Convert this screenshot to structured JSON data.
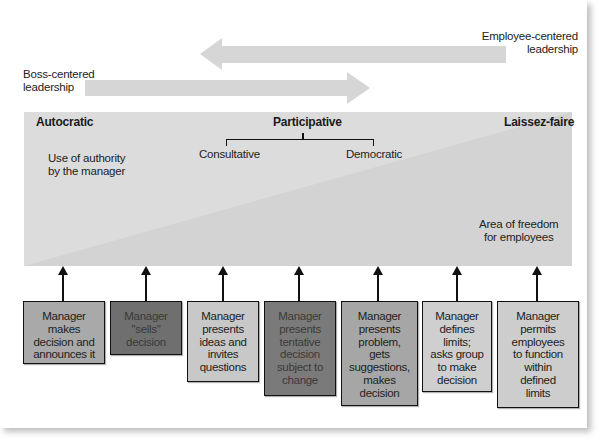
{
  "diagram": {
    "top_arrows": {
      "employee_centered": "Employee-centered\nleadership",
      "boss_centered": "Boss-centered\nleadership"
    },
    "band": {
      "autocratic": "Autocratic",
      "participative": "Participative",
      "laissez_faire": "Laissez-faire",
      "consultative": "Consultative",
      "democratic": "Democratic",
      "authority": "Use of authority\nby the manager",
      "freedom": "Area of freedom\nfor employees"
    },
    "boxes": [
      {
        "text": "Manager\nmakes\ndecision and\nannounces it",
        "color": "#a9a9a9"
      },
      {
        "text": "Manager\n\"sells\"\ndecision",
        "color": "#6f6f6f"
      },
      {
        "text": "Manager\npresents\nideas and\ninvites\nquestions",
        "color": "#c8c8c8"
      },
      {
        "text": "Manager\npresents\ntentative\ndecision\nsubject to\nchange",
        "color": "#7a7a7a"
      },
      {
        "text": "Manager\npresents\nproblem,\ngets\nsuggestions,\nmakes\ndecision",
        "color": "#a6a6a6"
      },
      {
        "text": "Manager\ndefines\nlimits;\nasks group\nto make\ndecision",
        "color": "#cfcfcf"
      },
      {
        "text": "Manager\npermits\nemployees\nto function\nwithin\ndefined\nlimits",
        "color": "#cdcdcd"
      }
    ],
    "colors": {
      "band": "#dcdcdc",
      "band_dark": "#d2d2d2",
      "arrow": "#d6d6d6"
    }
  }
}
